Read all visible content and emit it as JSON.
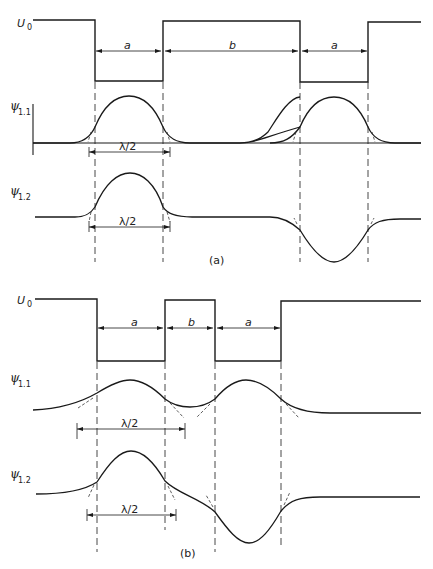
{
  "figure": {
    "panels": [
      {
        "id": "a",
        "caption": "(a)",
        "potential_label": "U",
        "potential_label_sub": "0",
        "well_width_label": "a",
        "barrier_width_label": "b",
        "wavefunctions": [
          {
            "label": "ψ",
            "sub": "1.1",
            "description": "symmetric",
            "half_wavelength_label": "λ/2"
          },
          {
            "label": "ψ",
            "sub": "1.2",
            "description": "antisymmetric",
            "half_wavelength_label": "λ/2"
          }
        ]
      },
      {
        "id": "b",
        "caption": "(b)",
        "potential_label": "U",
        "potential_label_sub": "0",
        "well_width_label": "a",
        "barrier_width_label": "b",
        "wavefunctions": [
          {
            "label": "ψ",
            "sub": "1.1",
            "description": "symmetric",
            "half_wavelength_label": "λ/2"
          },
          {
            "label": "ψ",
            "sub": "1.2",
            "description": "antisymmetric",
            "half_wavelength_label": "λ/2"
          }
        ]
      }
    ]
  }
}
